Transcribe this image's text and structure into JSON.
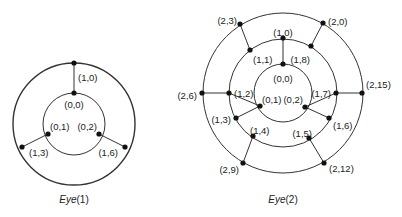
{
  "diagrams": [
    {
      "title": "Eye",
      "title_arg": "(1)",
      "center": [
        74,
        124
      ],
      "rings": [
        31,
        61
      ],
      "nodes": [
        {
          "label": "(0,0)",
          "x": 74,
          "y": 93,
          "lx": 74,
          "ly": 105,
          "anchor": "middle"
        },
        {
          "label": "(0,1)",
          "x": 48,
          "y": 134,
          "lx": 50,
          "ly": 127,
          "anchor": "start"
        },
        {
          "label": "(0,2)",
          "x": 99,
          "y": 134,
          "lx": 97,
          "ly": 127,
          "anchor": "end"
        },
        {
          "label": "(1,0)",
          "x": 74,
          "y": 63,
          "lx": 78,
          "ly": 78,
          "anchor": "start"
        },
        {
          "label": "(1,3)",
          "x": 22,
          "y": 147,
          "lx": 29,
          "ly": 153,
          "anchor": "start"
        },
        {
          "label": "(1,6)",
          "x": 125,
          "y": 147,
          "lx": 118,
          "ly": 153,
          "anchor": "end"
        }
      ],
      "edges": [
        [
          0,
          3
        ],
        [
          1,
          4
        ],
        [
          2,
          5
        ]
      ],
      "caption_pos": [
        74,
        203
      ]
    },
    {
      "title": "Eye",
      "title_arg": "(2)",
      "center": [
        283,
        93
      ],
      "rings": [
        29,
        54,
        80
      ],
      "nodes": [
        {
          "label": "(0,0)",
          "x": 283,
          "y": 64,
          "lx": 283,
          "ly": 79,
          "anchor": "middle"
        },
        {
          "label": "(0,1)",
          "x": 260,
          "y": 106,
          "lx": 262,
          "ly": 100,
          "anchor": "start"
        },
        {
          "label": "(0,2)",
          "x": 305,
          "y": 107,
          "lx": 303,
          "ly": 100,
          "anchor": "end"
        },
        {
          "label": "(1,0)",
          "x": 283,
          "y": 38,
          "lx": 283,
          "ly": 33,
          "anchor": "middle"
        },
        {
          "label": "(1,1)",
          "x": 250,
          "y": 50,
          "lx": 253,
          "ly": 60,
          "anchor": "start"
        },
        {
          "label": "(1,2)",
          "x": 229,
          "y": 93,
          "lx": 234,
          "ly": 94,
          "anchor": "start"
        },
        {
          "label": "(1,3)",
          "x": 236,
          "y": 118,
          "lx": 231,
          "ly": 120,
          "anchor": "end"
        },
        {
          "label": "(1,4)",
          "x": 253,
          "y": 136,
          "lx": 250,
          "ly": 131,
          "anchor": "start"
        },
        {
          "label": "(1,5)",
          "x": 309,
          "y": 138,
          "lx": 312,
          "ly": 134,
          "anchor": "end"
        },
        {
          "label": "(1,6)",
          "x": 329,
          "y": 118,
          "lx": 333,
          "ly": 126,
          "anchor": "start"
        },
        {
          "label": "(1,7)",
          "x": 336,
          "y": 93,
          "lx": 331,
          "ly": 94,
          "anchor": "end"
        },
        {
          "label": "(1,8)",
          "x": 311,
          "y": 46,
          "lx": 310,
          "ly": 60,
          "anchor": "end"
        },
        {
          "label": "(2,0)",
          "x": 323,
          "y": 23,
          "lx": 328,
          "ly": 22,
          "anchor": "start"
        },
        {
          "label": "(2,3)",
          "x": 240,
          "y": 24,
          "lx": 237,
          "ly": 21,
          "anchor": "end"
        },
        {
          "label": "(2,6)",
          "x": 202,
          "y": 93,
          "lx": 197,
          "ly": 96,
          "anchor": "end"
        },
        {
          "label": "(2,9)",
          "x": 243,
          "y": 163,
          "lx": 239,
          "ly": 170,
          "anchor": "end"
        },
        {
          "label": "(2,12)",
          "x": 324,
          "y": 163,
          "lx": 329,
          "ly": 169,
          "anchor": "start"
        },
        {
          "label": "(2,15)",
          "x": 362,
          "y": 93,
          "lx": 366,
          "ly": 85,
          "anchor": "start"
        }
      ],
      "edges": [
        [
          0,
          3
        ],
        [
          1,
          5
        ],
        [
          2,
          10
        ],
        [
          4,
          13
        ],
        [
          11,
          12
        ],
        [
          5,
          14
        ],
        [
          10,
          17
        ],
        [
          7,
          15
        ],
        [
          8,
          16
        ],
        [
          1,
          6
        ],
        [
          2,
          9
        ]
      ],
      "caption_pos": [
        283,
        203
      ]
    }
  ],
  "colors": {
    "stroke": "#333333",
    "node": "#111111",
    "text": "#222222"
  }
}
